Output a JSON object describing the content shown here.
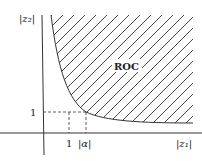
{
  "diagram": {
    "x_axis_label": "|z₁|",
    "y_axis_label": "|z₂|",
    "region_label": "ROC",
    "x_ticks": [
      {
        "label": "1",
        "value": 1
      },
      {
        "label": "|α|",
        "value": "alpha"
      }
    ],
    "y_ticks": [
      {
        "label": "1",
        "value": 1
      }
    ],
    "boundary": "hyperbola |z1|·|z2| = |α|, region above/right hatched",
    "colors": {
      "line": "#333333",
      "hatch": "#333333",
      "background": "#ffffff"
    }
  }
}
